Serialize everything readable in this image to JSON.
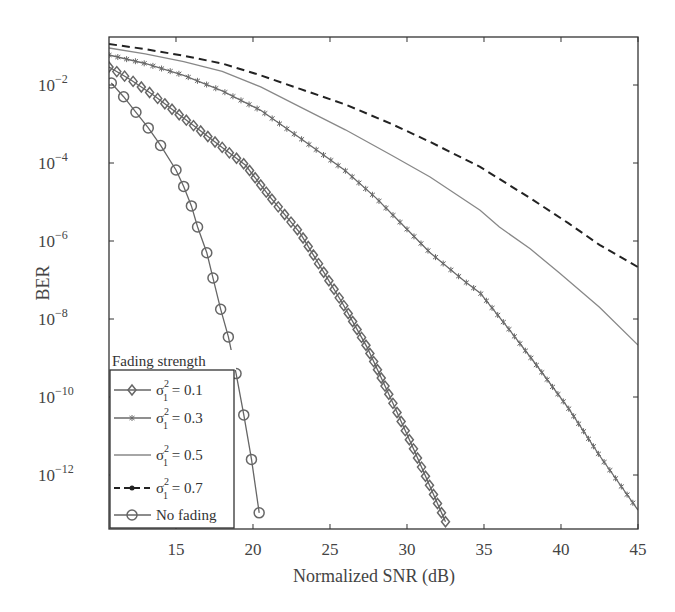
{
  "chart_data": {
    "type": "line",
    "title": "",
    "xlabel": "Normalized SNR (dB)",
    "ylabel": "BER",
    "xscale": "linear",
    "yscale": "log",
    "xlim": [
      10.65,
      45
    ],
    "ylim": [
      4e-14,
      0.17
    ],
    "xticks": [
      15,
      20,
      25,
      30,
      35,
      40,
      45
    ],
    "xtick_labels": [
      "15",
      "20",
      "25",
      "30",
      "35",
      "40",
      "45"
    ],
    "yticks_exp": [
      -2,
      -4,
      -6,
      -8,
      -10,
      -12
    ],
    "ytick_labels": [
      "10^-2",
      "10^-4",
      "10^-6",
      "10^-8",
      "10^-10",
      "10^-12"
    ],
    "grid": false,
    "legend": {
      "title": "Fading strength",
      "position": "lower left",
      "entries": [
        "σ1² = 0.1",
        "σ1² = 0.3",
        "σ1² = 0.5",
        "σ1² = 0.7",
        "No fading"
      ]
    },
    "series": [
      {
        "name": "σ1² = 0.1",
        "label_main": "σ",
        "label_sup": "2",
        "label_sub": "1",
        "label_value": " = 0.1",
        "style": "solid",
        "marker": "diamond",
        "color": "#666666",
        "x": [
          10.65,
          12.0,
          13.5,
          15.0,
          16.5,
          18.0,
          19.5,
          21.1,
          23.05,
          25.8,
          27.4,
          28.9,
          30.5,
          32.5
        ],
        "log10_y": [
          -1.54,
          -1.85,
          -2.25,
          -2.7,
          -3.15,
          -3.6,
          -4.05,
          -4.87,
          -5.79,
          -7.59,
          -8.72,
          -10.0,
          -11.4,
          -13.2
        ]
      },
      {
        "name": "σ1² = 0.3",
        "label_main": "σ",
        "label_sup": "2",
        "label_sub": "1",
        "label_value": " = 0.3",
        "style": "solid",
        "marker": "star",
        "color": "#6a6a6a",
        "x": [
          10.65,
          13.0,
          15.5,
          18.0,
          20.5,
          23.05,
          26.0,
          28.0,
          30.0,
          31.5,
          33.8,
          34.75,
          36.5,
          38.4,
          40.5,
          42.5,
          45.0
        ],
        "log10_y": [
          -1.23,
          -1.45,
          -1.75,
          -2.15,
          -2.65,
          -3.36,
          -4.2,
          -4.9,
          -5.7,
          -6.3,
          -7.05,
          -7.33,
          -8.2,
          -9.18,
          -10.3,
          -11.5,
          -12.9
        ]
      },
      {
        "name": "σ1² = 0.5",
        "label_main": "σ",
        "label_sup": "2",
        "label_sub": "1",
        "label_value": " = 0.5",
        "style": "solid",
        "marker": "none",
        "color": "#888888",
        "x": [
          10.65,
          13.0,
          15.5,
          18.0,
          20.5,
          23.05,
          26.0,
          29.0,
          31.5,
          34.75,
          36.0,
          38.0,
          39.9,
          42.5,
          45.0
        ],
        "log10_y": [
          -1.05,
          -1.2,
          -1.4,
          -1.65,
          -2.05,
          -2.56,
          -3.15,
          -3.8,
          -4.36,
          -5.21,
          -5.64,
          -6.2,
          -6.82,
          -7.7,
          -8.67
        ]
      },
      {
        "name": "σ1² = 0.7",
        "label_main": "σ",
        "label_sup": "2",
        "label_sub": "1",
        "label_value": " = 0.7",
        "style": "dashed",
        "marker": "dot",
        "color": "#222222",
        "x": [
          10.65,
          13.0,
          15.5,
          18.0,
          20.5,
          23.05,
          26.0,
          29.0,
          31.5,
          34.75,
          38.2,
          40.5,
          42.5,
          45.0
        ],
        "log10_y": [
          -0.95,
          -1.08,
          -1.25,
          -1.45,
          -1.75,
          -2.1,
          -2.5,
          -3.0,
          -3.46,
          -4.1,
          -4.95,
          -5.55,
          -6.1,
          -6.67
        ]
      },
      {
        "name": "No fading",
        "label_main": "No fading",
        "label_sup": "",
        "label_sub": "",
        "label_value": "",
        "style": "solid",
        "marker": "circle",
        "color": "#666666",
        "x": [
          10.8,
          11.6,
          12.4,
          13.2,
          14.0,
          15.0,
          15.5,
          16.0,
          16.4,
          17.0,
          17.4,
          17.9,
          18.4,
          18.9,
          19.4,
          19.9,
          20.4
        ],
        "log10_y": [
          -1.95,
          -2.3,
          -2.7,
          -3.1,
          -3.55,
          -4.18,
          -4.6,
          -5.1,
          -5.64,
          -6.3,
          -6.95,
          -7.75,
          -8.46,
          -9.4,
          -10.46,
          -11.6,
          -12.97
        ]
      }
    ]
  }
}
